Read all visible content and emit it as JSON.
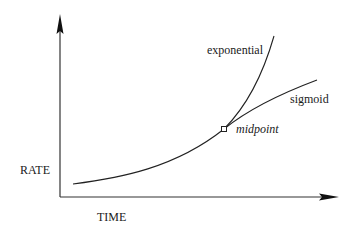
{
  "diagram": {
    "y_axis_label": "RATE",
    "x_axis_label": "TIME",
    "curves": [
      {
        "name": "exponential",
        "label": "exponential"
      },
      {
        "name": "sigmoid",
        "label": "sigmoid"
      }
    ],
    "annotation": "midpoint",
    "colors": {
      "line": "#1a1a1a",
      "background": "#ffffff"
    }
  }
}
